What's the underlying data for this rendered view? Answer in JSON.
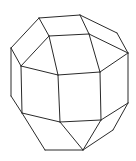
{
  "figure": {
    "type": "polyhedron-line-drawing",
    "stroke_color": "#2a2a2a",
    "background": "#ffffff"
  },
  "vertices": {
    "A": [
      39,
      18
    ],
    "B": [
      80,
      15
    ],
    "C": [
      49,
      36
    ],
    "D": [
      89,
      34
    ],
    "E": [
      11,
      48
    ],
    "F": [
      21,
      66
    ],
    "G": [
      58,
      75
    ],
    "H": [
      100,
      72
    ],
    "I": [
      117,
      33
    ],
    "J": [
      128,
      53
    ],
    "K": [
      11,
      96
    ],
    "L": [
      22,
      113
    ],
    "M": [
      60,
      122
    ],
    "N": [
      101,
      120
    ],
    "O": [
      128,
      103
    ],
    "P": [
      113,
      130
    ],
    "Q": [
      83,
      150
    ],
    "R": [
      45,
      150
    ]
  },
  "edges": [
    [
      "A",
      "B"
    ],
    [
      "A",
      "C"
    ],
    [
      "B",
      "D"
    ],
    [
      "C",
      "D"
    ],
    [
      "A",
      "E"
    ],
    [
      "E",
      "F"
    ],
    [
      "C",
      "F"
    ],
    [
      "C",
      "G"
    ],
    [
      "F",
      "G"
    ],
    [
      "G",
      "H"
    ],
    [
      "D",
      "H"
    ],
    [
      "B",
      "I"
    ],
    [
      "I",
      "J"
    ],
    [
      "D",
      "J"
    ],
    [
      "H",
      "J"
    ],
    [
      "E",
      "K"
    ],
    [
      "F",
      "L"
    ],
    [
      "K",
      "L"
    ],
    [
      "G",
      "M"
    ],
    [
      "H",
      "N"
    ],
    [
      "J",
      "O"
    ],
    [
      "L",
      "M"
    ],
    [
      "M",
      "N"
    ],
    [
      "N",
      "O"
    ],
    [
      "L",
      "R"
    ],
    [
      "R",
      "Q"
    ],
    [
      "M",
      "Q"
    ],
    [
      "N",
      "Q"
    ],
    [
      "O",
      "P"
    ],
    [
      "P",
      "Q"
    ]
  ]
}
